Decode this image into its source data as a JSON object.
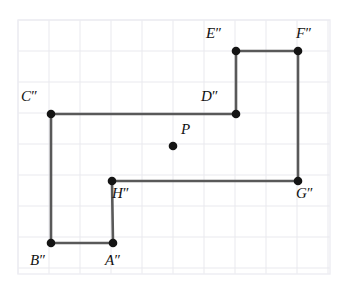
{
  "figure": {
    "background_color": "#ffffff",
    "grid": {
      "visible": true,
      "color": "#e9e9ee",
      "border_color": "#ededf2",
      "cell_size": 31,
      "origin_x": 18,
      "origin_y": 20,
      "cols": 10,
      "rows": 8,
      "width": 312,
      "height": 254
    },
    "style": {
      "edge_color": "#595959",
      "edge_width": 2.6,
      "vertex_color": "#141414",
      "vertex_radius": 4.3,
      "point_radius": 4.3,
      "label_color": "#111111",
      "label_font_size": 15
    },
    "vertices": [
      {
        "id": "A",
        "label": "A",
        "prime": "″",
        "x": 113,
        "y": 243,
        "label_x": 105,
        "label_y": 253,
        "label_anchor": "below-right"
      },
      {
        "id": "B",
        "label": "B",
        "prime": "″",
        "x": 51,
        "y": 243,
        "label_x": 30,
        "label_y": 253,
        "label_anchor": "below-left"
      },
      {
        "id": "C",
        "label": "C",
        "prime": "″",
        "x": 51,
        "y": 114,
        "label_x": 21,
        "label_y": 89,
        "label_anchor": "above-left"
      },
      {
        "id": "D",
        "label": "D",
        "prime": "″",
        "x": 236,
        "y": 114,
        "label_x": 201,
        "label_y": 89,
        "label_anchor": "above-left"
      },
      {
        "id": "E",
        "label": "E",
        "prime": "″",
        "x": 236,
        "y": 51,
        "label_x": 206,
        "label_y": 26,
        "label_anchor": "above-left"
      },
      {
        "id": "F",
        "label": "F",
        "prime": "″",
        "x": 298,
        "y": 51,
        "label_x": 296,
        "label_y": 26,
        "label_anchor": "above-right"
      },
      {
        "id": "G",
        "label": "G",
        "prime": "″",
        "x": 298,
        "y": 181,
        "label_x": 296,
        "label_y": 186,
        "label_anchor": "below-right"
      },
      {
        "id": "H",
        "label": "H",
        "prime": "″",
        "x": 112,
        "y": 181,
        "label_x": 112,
        "label_y": 186,
        "label_anchor": "below-right"
      }
    ],
    "edges": [
      {
        "from": "A",
        "to": "B"
      },
      {
        "from": "B",
        "to": "C"
      },
      {
        "from": "C",
        "to": "D"
      },
      {
        "from": "D",
        "to": "E"
      },
      {
        "from": "E",
        "to": "F"
      },
      {
        "from": "F",
        "to": "G"
      },
      {
        "from": "G",
        "to": "H"
      },
      {
        "from": "H",
        "to": "A"
      }
    ],
    "path_points": "113,243 51,243 51,114 236,114 236,51 298,51 298,181 112,181 113,243",
    "marked_points": [
      {
        "id": "P",
        "label": "P",
        "prime": "",
        "x": 173,
        "y": 146,
        "label_x": 181,
        "label_y": 122,
        "label_anchor": "above-right"
      }
    ]
  }
}
